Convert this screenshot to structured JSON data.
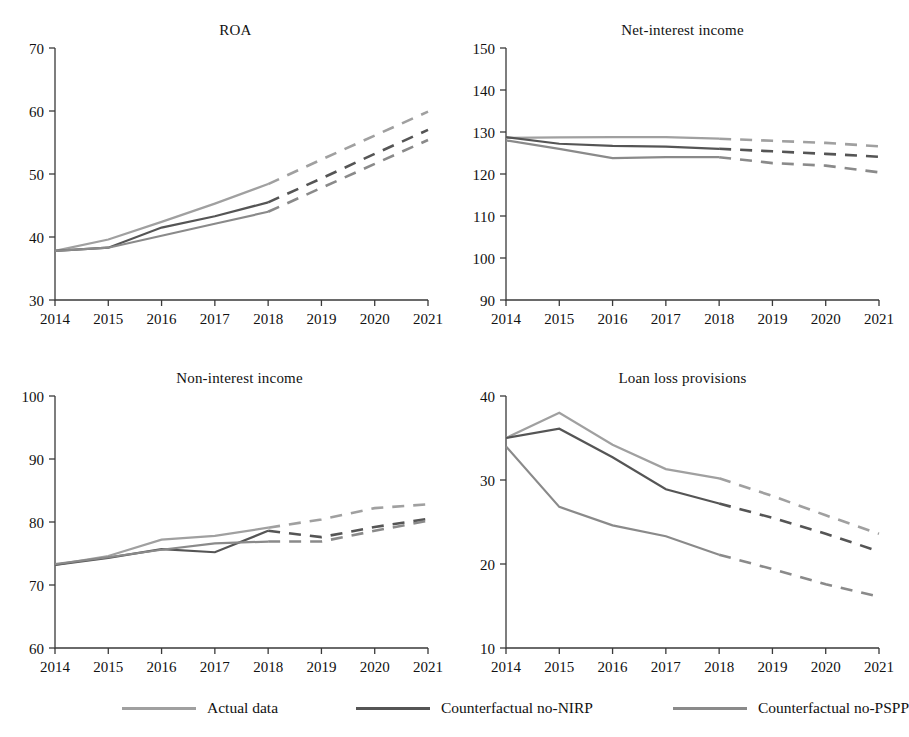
{
  "figure": {
    "legend": {
      "position": "bottom",
      "entries": [
        {
          "label": "Actual data",
          "color": "#a0a0a0"
        },
        {
          "label": "Counterfactual no-NIRP",
          "color": "#555555"
        },
        {
          "label": "Counterfactual no-PSPP",
          "color": "#8a8a8a"
        }
      ]
    }
  },
  "chart_data": [
    {
      "type": "line",
      "title": "ROA",
      "xlabel": "",
      "ylabel": "",
      "x": [
        2014,
        2015,
        2016,
        2017,
        2018,
        2019,
        2020,
        2021
      ],
      "xticklabels": [
        "2014",
        "2015",
        "2016",
        "2017",
        "2018",
        "2019",
        "2020",
        "2021"
      ],
      "xlim": [
        2014,
        2021
      ],
      "ylim": [
        30,
        70
      ],
      "yticks": [
        30,
        40,
        50,
        60,
        70
      ],
      "yticklabels": [
        "30",
        "40",
        "50",
        "60",
        "70"
      ],
      "grid": false,
      "forecast_start": 2018,
      "series": [
        {
          "name": "Actual data",
          "color": "#a0a0a0",
          "values": [
            37.8,
            39.6,
            42.4,
            45.3,
            48.4,
            52.3,
            56.1,
            59.9
          ]
        },
        {
          "name": "Counterfactual no-NIRP",
          "color": "#555555",
          "values": [
            37.8,
            38.3,
            41.5,
            43.3,
            45.5,
            49.3,
            53.2,
            57.0
          ]
        },
        {
          "name": "Counterfactual no-PSPP",
          "color": "#8a8a8a",
          "values": [
            37.8,
            38.3,
            40.2,
            42.1,
            44.0,
            47.8,
            51.6,
            55.4
          ]
        }
      ]
    },
    {
      "type": "line",
      "title": "Net-interest income",
      "xlabel": "",
      "ylabel": "",
      "x": [
        2014,
        2015,
        2016,
        2017,
        2018,
        2019,
        2020,
        2021
      ],
      "xticklabels": [
        "2014",
        "2015",
        "2016",
        "2017",
        "2018",
        "2019",
        "2020",
        "2021"
      ],
      "xlim": [
        2014,
        2021
      ],
      "ylim": [
        90,
        150
      ],
      "yticks": [
        90,
        100,
        110,
        120,
        130,
        140,
        150
      ],
      "yticklabels": [
        "90",
        "100",
        "110",
        "120",
        "130",
        "140",
        "150"
      ],
      "grid": false,
      "forecast_start": 2018,
      "series": [
        {
          "name": "Actual data",
          "color": "#a0a0a0",
          "values": [
            128.6,
            128.7,
            128.8,
            128.8,
            128.4,
            127.9,
            127.4,
            126.6
          ]
        },
        {
          "name": "Counterfactual no-NIRP",
          "color": "#555555",
          "values": [
            128.8,
            127.2,
            126.7,
            126.5,
            126.0,
            125.4,
            124.8,
            124.1
          ]
        },
        {
          "name": "Counterfactual no-PSPP",
          "color": "#8a8a8a",
          "values": [
            128.0,
            126.0,
            123.8,
            124.0,
            124.0,
            122.6,
            122.0,
            120.4
          ]
        }
      ]
    },
    {
      "type": "line",
      "title": "Non-interest income",
      "xlabel": "",
      "ylabel": "",
      "x": [
        2014,
        2015,
        2016,
        2017,
        2018,
        2019,
        2020,
        2021
      ],
      "xticklabels": [
        "2014",
        "2015",
        "2016",
        "2017",
        "2018",
        "2019",
        "2020",
        "2021"
      ],
      "xlim": [
        2014,
        2021
      ],
      "ylim": [
        60,
        100
      ],
      "yticks": [
        60,
        70,
        80,
        90,
        100
      ],
      "yticklabels": [
        "60",
        "70",
        "80",
        "90",
        "100"
      ],
      "grid": false,
      "forecast_start": 2018,
      "series": [
        {
          "name": "Actual data",
          "color": "#a0a0a0",
          "values": [
            73.2,
            74.6,
            77.2,
            77.8,
            79.1,
            80.4,
            82.2,
            82.8
          ]
        },
        {
          "name": "Counterfactual no-NIRP",
          "color": "#555555",
          "values": [
            73.2,
            74.3,
            75.7,
            75.2,
            78.6,
            77.6,
            79.2,
            80.5
          ]
        },
        {
          "name": "Counterfactual no-PSPP",
          "color": "#8a8a8a",
          "values": [
            73.3,
            74.4,
            75.6,
            76.6,
            76.9,
            76.9,
            78.6,
            80.2
          ]
        }
      ]
    },
    {
      "type": "line",
      "title": "Loan loss provisions",
      "xlabel": "",
      "ylabel": "",
      "x": [
        2014,
        2015,
        2016,
        2017,
        2018,
        2019,
        2020,
        2021
      ],
      "xticklabels": [
        "2014",
        "2015",
        "2016",
        "2017",
        "2018",
        "2019",
        "2020",
        "2021"
      ],
      "xlim": [
        2014,
        2021
      ],
      "ylim": [
        10,
        40
      ],
      "yticks": [
        10,
        20,
        30,
        40
      ],
      "yticklabels": [
        "10",
        "20",
        "30",
        "40"
      ],
      "grid": false,
      "forecast_start": 2018,
      "series": [
        {
          "name": "Actual data",
          "color": "#a0a0a0",
          "values": [
            35.0,
            38.0,
            34.2,
            31.3,
            30.2,
            28.1,
            25.8,
            23.6
          ]
        },
        {
          "name": "Counterfactual no-NIRP",
          "color": "#555555",
          "values": [
            35.0,
            36.1,
            32.7,
            28.9,
            27.2,
            25.5,
            23.6,
            21.5
          ]
        },
        {
          "name": "Counterfactual no-PSPP",
          "color": "#8a8a8a",
          "values": [
            34.0,
            26.8,
            24.6,
            23.3,
            21.1,
            19.4,
            17.6,
            16.1
          ]
        }
      ]
    }
  ]
}
